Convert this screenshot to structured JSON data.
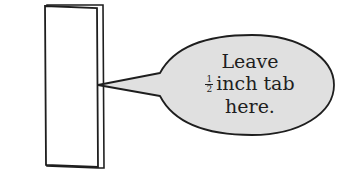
{
  "diagram": {
    "colors": {
      "background": "#ffffff",
      "outline": "#1e1e1e",
      "bubble_fill": "#e0e0e0",
      "paper_fill": "#ffffff"
    },
    "callout": {
      "line1": "Leave",
      "fraction_numerator": "1",
      "fraction_denominator": "2",
      "line2_rest": "inch tab",
      "line3": "here."
    }
  }
}
